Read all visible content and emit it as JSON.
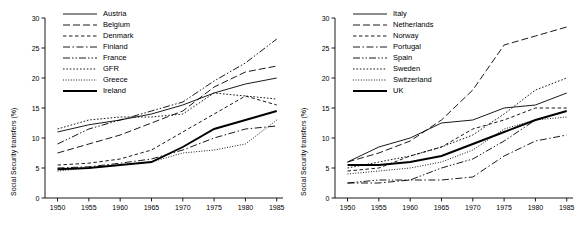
{
  "chart_data": [
    {
      "id": "left",
      "type": "line",
      "title": "",
      "xlabel": "",
      "ylabel": "Social Security transfers (%)",
      "xlim": [
        1948,
        1986
      ],
      "ylim": [
        0,
        30
      ],
      "xticks": [
        1950,
        1955,
        1960,
        1965,
        1970,
        1975,
        1980,
        1985
      ],
      "yticks": [
        0,
        5,
        10,
        15,
        20,
        25,
        30
      ],
      "grid": false,
      "legend_position": "top-center",
      "x": [
        1950,
        1955,
        1960,
        1965,
        1970,
        1975,
        1980,
        1985
      ],
      "series": [
        {
          "name": "Austria",
          "dash": "solid",
          "values": [
            11.0,
            12.2,
            13.0,
            14.0,
            15.5,
            17.5,
            19.0,
            20.0
          ]
        },
        {
          "name": "Belgium",
          "dash": "dash-long",
          "values": [
            7.5,
            9.0,
            10.5,
            12.5,
            14.5,
            18.5,
            21.0,
            22.0
          ]
        },
        {
          "name": "Denmark",
          "dash": "dash-short",
          "values": [
            5.5,
            5.8,
            6.5,
            8.0,
            11.0,
            14.0,
            17.0,
            15.5
          ]
        },
        {
          "name": "Finland",
          "dash": "dash-dot",
          "values": [
            5.0,
            5.2,
            5.8,
            6.5,
            8.0,
            10.0,
            11.5,
            12.0
          ]
        },
        {
          "name": "France",
          "dash": "dash-dot-dot",
          "values": [
            9.0,
            11.5,
            13.0,
            14.5,
            16.0,
            19.5,
            22.5,
            26.5
          ]
        },
        {
          "name": "GFR",
          "dash": "dot",
          "values": [
            11.5,
            13.0,
            13.5,
            13.5,
            14.0,
            17.5,
            17.0,
            16.5
          ]
        },
        {
          "name": "Greece",
          "dash": "dot-fine",
          "values": [
            4.5,
            5.0,
            5.5,
            6.0,
            7.5,
            8.0,
            9.0,
            13.0
          ]
        },
        {
          "name": "Ireland",
          "dash": "solid-bold",
          "values": [
            4.8,
            5.0,
            5.5,
            6.0,
            8.5,
            11.5,
            13.0,
            14.5
          ]
        }
      ]
    },
    {
      "id": "right",
      "type": "line",
      "title": "",
      "xlabel": "",
      "ylabel": "Social Security transfers (%)",
      "xlim": [
        1948,
        1986
      ],
      "ylim": [
        0,
        30
      ],
      "xticks": [
        1950,
        1955,
        1960,
        1965,
        1970,
        1975,
        1980,
        1985
      ],
      "yticks": [
        0,
        5,
        10,
        15,
        20,
        25,
        30
      ],
      "grid": false,
      "legend_position": "top-center",
      "x": [
        1950,
        1955,
        1960,
        1965,
        1970,
        1975,
        1980,
        1985
      ],
      "series": [
        {
          "name": "Italy",
          "dash": "solid",
          "values": [
            6.0,
            8.5,
            10.0,
            12.5,
            13.0,
            15.0,
            15.5,
            17.5
          ]
        },
        {
          "name": "Netherlands",
          "dash": "dash-long",
          "values": [
            6.0,
            7.5,
            9.5,
            13.0,
            18.0,
            25.5,
            27.0,
            28.5
          ]
        },
        {
          "name": "Norway",
          "dash": "dash-short",
          "values": [
            4.5,
            5.0,
            7.0,
            8.5,
            11.5,
            13.0,
            15.0,
            15.0
          ]
        },
        {
          "name": "Portugal",
          "dash": "dash-dot",
          "values": [
            2.5,
            2.5,
            3.0,
            3.0,
            3.5,
            7.0,
            9.5,
            10.5
          ]
        },
        {
          "name": "Spain",
          "dash": "dash-dot-dot",
          "values": [
            2.5,
            3.0,
            3.0,
            5.0,
            6.5,
            9.5,
            13.0,
            14.5
          ]
        },
        {
          "name": "Sweden",
          "dash": "dot",
          "values": [
            5.0,
            6.0,
            7.0,
            8.5,
            10.5,
            14.0,
            18.0,
            20.0
          ]
        },
        {
          "name": "Switzerland",
          "dash": "dot-fine",
          "values": [
            4.0,
            4.5,
            5.0,
            6.0,
            8.0,
            11.5,
            13.0,
            13.5
          ]
        },
        {
          "name": "UK",
          "dash": "solid-bold",
          "values": [
            5.5,
            5.5,
            6.0,
            7.0,
            9.0,
            11.0,
            13.0,
            14.5
          ]
        }
      ]
    }
  ]
}
